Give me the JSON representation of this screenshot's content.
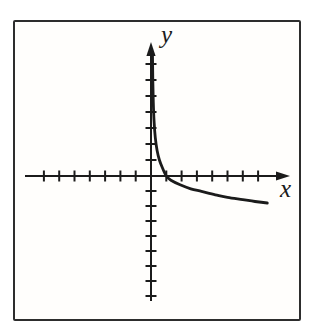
{
  "figure": {
    "background_color": "#ffffff",
    "paper_color": "#fffefc",
    "frame_color": "#2d2d2d",
    "line_color": "#1b1b1b"
  },
  "chart_data": {
    "type": "line",
    "title": "",
    "xlabel": "x",
    "ylabel": "y",
    "grid": false,
    "legend": false,
    "x_axis": {
      "min": -7,
      "max": 7.8,
      "tick_step": 1,
      "ticks": [
        -7,
        -6,
        -5,
        -4,
        -3,
        -2,
        -1,
        1,
        2,
        3,
        4,
        5,
        6,
        7
      ],
      "tick_labels_shown": false,
      "arrow_at_positive_end": true
    },
    "y_axis": {
      "min": -8,
      "max": 7.8,
      "tick_step": 1,
      "ticks": [
        -8,
        -7,
        -6,
        -5,
        -4,
        -3,
        -2,
        -1,
        1,
        2,
        3,
        4,
        5,
        6,
        7
      ],
      "tick_labels_shown": false,
      "arrow_at_positive_end": true
    },
    "series": [
      {
        "name": "logarithmic-curve",
        "description": "Smooth decreasing concave-up curve resembling y = -log(x): asymptotic to the positive y-axis as x approaches 0 from the right, crossing the x-axis at x = 1, then flattening as it falls to the right",
        "x_intercept": 1,
        "vertical_asymptote": "x = 0",
        "points": [
          [
            0.1,
            7.5
          ],
          [
            0.12,
            6.0
          ],
          [
            0.15,
            4.6
          ],
          [
            0.2,
            3.4
          ],
          [
            0.28,
            2.4
          ],
          [
            0.4,
            1.6
          ],
          [
            0.55,
            1.0
          ],
          [
            0.75,
            0.5
          ],
          [
            1.0,
            0.0
          ],
          [
            1.3,
            -0.28
          ],
          [
            1.9,
            -0.58
          ],
          [
            2.6,
            -0.85
          ],
          [
            3.3,
            -1.03
          ],
          [
            4.2,
            -1.25
          ],
          [
            5.0,
            -1.42
          ],
          [
            6.0,
            -1.57
          ],
          [
            6.8,
            -1.7
          ],
          [
            7.6,
            -1.8
          ]
        ]
      }
    ]
  }
}
